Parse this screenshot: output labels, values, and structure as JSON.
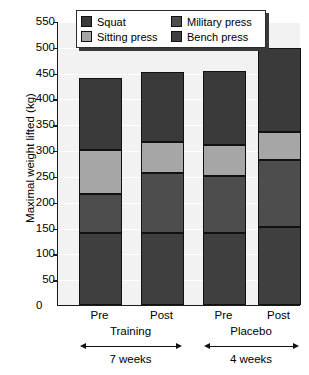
{
  "chart_data": {
    "type": "bar",
    "subtype": "stacked",
    "title": "",
    "xlabel": "",
    "ylabel": "Maximal weight lifted (kg)",
    "ylim": [
      0,
      550
    ],
    "ytick_step": 50,
    "yticks": [
      50,
      100,
      150,
      200,
      250,
      300,
      350,
      400,
      450,
      500,
      550
    ],
    "ytick_labels": [
      "50",
      "100",
      "150",
      "200",
      "250",
      "300",
      "350",
      "400",
      "450",
      "500",
      "550"
    ],
    "grid": true,
    "grid_axis": "y",
    "legend_position": "upper center",
    "categories": [
      "Pre",
      "Post",
      "Pre",
      "Post"
    ],
    "group_labels": [
      "Training",
      "Placebo"
    ],
    "group_durations": [
      "7 weeks",
      "4 weeks"
    ],
    "series": [
      {
        "name": "Bench press",
        "color": "#3f3f3f",
        "values": [
          140,
          140,
          140,
          152
        ]
      },
      {
        "name": "Military press",
        "color": "#4d4d4d",
        "values": [
          75,
          115,
          110,
          128
        ]
      },
      {
        "name": "Sitting press",
        "color": "#a6a6a6",
        "values": [
          85,
          60,
          60,
          55
        ]
      },
      {
        "name": "Squat",
        "color": "#3a3a3a",
        "values": [
          140,
          137,
          143,
          162
        ]
      }
    ],
    "bar_totals": [
      440,
      452,
      453,
      497
    ],
    "segment_boundaries": [
      [
        0,
        140,
        215,
        300,
        440
      ],
      [
        0,
        140,
        255,
        315,
        452
      ],
      [
        0,
        140,
        250,
        310,
        453
      ],
      [
        0,
        152,
        280,
        335,
        497
      ]
    ],
    "axis_color": "#1a1a1a",
    "plot_background": "#f2f2f2",
    "gridline_color": "#ffffff"
  },
  "legend": {
    "items": [
      {
        "label": "Squat",
        "color": "#3a3a3a"
      },
      {
        "label": "Military press",
        "color": "#4d4d4d"
      },
      {
        "label": "Sitting press",
        "color": "#a6a6a6"
      },
      {
        "label": "Bench press",
        "color": "#3f3f3f"
      }
    ]
  },
  "axes": {
    "y_title": "Maximal weight lifted (kg)",
    "zero_label": "0"
  },
  "xaxis": {
    "ticks": [
      "Pre",
      "Post",
      "Pre",
      "Post"
    ],
    "groups": [
      {
        "label": "Training",
        "duration": "7 weeks"
      },
      {
        "label": "Placebo",
        "duration": "4 weeks"
      }
    ]
  }
}
